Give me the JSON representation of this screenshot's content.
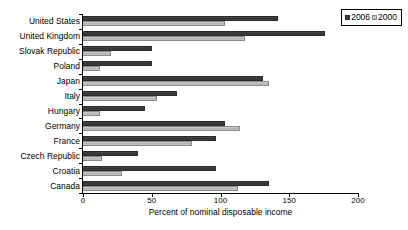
{
  "chart_data": {
    "type": "bar",
    "orientation": "horizontal",
    "title": "",
    "xlabel": "Percent of nominal disposable income",
    "ylabel": "",
    "xlim": [
      0,
      200
    ],
    "xticks": [
      "0",
      "50",
      "100",
      "150",
      "200"
    ],
    "grid": false,
    "legend_position": "top-right",
    "categories": [
      "United States",
      "United Kingdom",
      "Slovak Republic",
      "Poland",
      "Japan",
      "Italy",
      "Hungary",
      "Germany",
      "France",
      "Czech Republic",
      "Croatia",
      "Canada"
    ],
    "series": [
      {
        "name": "2006",
        "color": "#3a3a3a",
        "values": [
          142,
          176,
          50,
          50,
          131,
          68,
          45,
          103,
          97,
          40,
          97,
          135
        ]
      },
      {
        "name": "2000",
        "color": "#c8c8c8",
        "values": [
          103,
          118,
          20,
          12,
          135,
          54,
          12,
          114,
          79,
          14,
          28,
          113
        ]
      }
    ]
  },
  "legend": {
    "entries": [
      {
        "label": "2006"
      },
      {
        "label": "2000"
      }
    ]
  },
  "axis": {
    "x_title": "Percent of nominal disposable income"
  }
}
